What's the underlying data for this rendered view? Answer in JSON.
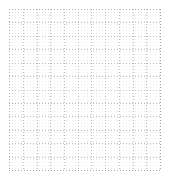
{
  "canvas": {
    "name": "dotted-grid-canvas",
    "width_px": 169,
    "height_px": 179,
    "background_color": "#ffffff",
    "content_text": ""
  },
  "grid": {
    "origin_x_px": 9,
    "origin_y_px": 9,
    "width_px": 151,
    "height_px": 161,
    "columns": 11,
    "rows": 12,
    "cell_width_px": 13.7,
    "cell_height_px": 13.4,
    "line_style": "dotted",
    "line_color": "#b9b9b9",
    "edge_line_color": "#a8a8a8",
    "dot_texture_color": "#ededed",
    "x_positions": [
      0,
      13.7,
      27.5,
      41.2,
      54.9,
      68.6,
      82.4,
      96.1,
      109.8,
      123.5,
      137.3,
      151
    ],
    "y_positions": [
      0,
      13.4,
      26.8,
      40.2,
      53.7,
      67.1,
      80.5,
      93.9,
      107.3,
      120.8,
      134.2,
      147.6,
      161
    ]
  }
}
